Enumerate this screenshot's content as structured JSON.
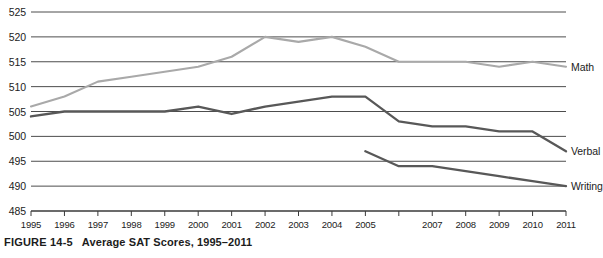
{
  "caption": {
    "figure_number": "FIGURE 14-5",
    "title": "Average SAT Scores, 1995–2011"
  },
  "colors": {
    "math_line": "#a9a9a9",
    "verbal_line": "#585858",
    "writing_line": "#585858",
    "gridline": "#4d4d4d",
    "axis": "#3a3a3a",
    "text": "#1c1c1c",
    "background": "#ffffff"
  },
  "chart_data": {
    "type": "line",
    "title": "Average SAT Scores, 1995–2011",
    "xlabel": "",
    "ylabel": "",
    "ylim": [
      485,
      525
    ],
    "ytick_values": [
      485,
      490,
      495,
      500,
      505,
      510,
      515,
      520,
      525
    ],
    "ytick_labels": [
      "485",
      "490",
      "495",
      "500",
      "505",
      "510",
      "515",
      "520",
      "525"
    ],
    "grid": true,
    "grid_axis": "y",
    "legend_position": "right-inline-end-labels",
    "x": [
      1995,
      1996,
      1997,
      1998,
      1999,
      2000,
      2001,
      2002,
      2003,
      2004,
      2005,
      2006,
      2007,
      2008,
      2009,
      2010,
      2011
    ],
    "xtick_labels": [
      "1995",
      "1996",
      "1997",
      "1998",
      "1999",
      "2000",
      "2001",
      "2002",
      "2003",
      "2004",
      "2005",
      "",
      "2007",
      "2008",
      "2009",
      "2010",
      "2011"
    ],
    "series": [
      {
        "name": "Math",
        "color": "#a9a9a9",
        "label": "Math",
        "x": [
          1995,
          1996,
          1997,
          1998,
          1999,
          2000,
          2001,
          2002,
          2003,
          2004,
          2005,
          2006,
          2007,
          2008,
          2009,
          2010,
          2011
        ],
        "values": [
          506,
          508,
          511,
          512,
          513,
          514,
          516,
          520,
          519,
          520,
          518,
          515,
          515,
          515,
          514,
          515,
          514
        ]
      },
      {
        "name": "Verbal",
        "color": "#585858",
        "label": "Verbal",
        "x": [
          1995,
          1996,
          1997,
          1998,
          1999,
          2000,
          2001,
          2002,
          2003,
          2004,
          2005,
          2006,
          2007,
          2008,
          2009,
          2010,
          2011
        ],
        "values": [
          504,
          505,
          505,
          505,
          505,
          506,
          504.5,
          506,
          507,
          508,
          508,
          503,
          502,
          502,
          501,
          501,
          497
        ]
      },
      {
        "name": "Writing",
        "color": "#585858",
        "label": "Writing",
        "x": [
          2005,
          2006,
          2007,
          2008,
          2009,
          2010,
          2011
        ],
        "values": [
          497,
          494,
          494,
          493,
          492,
          491,
          490
        ]
      }
    ]
  }
}
